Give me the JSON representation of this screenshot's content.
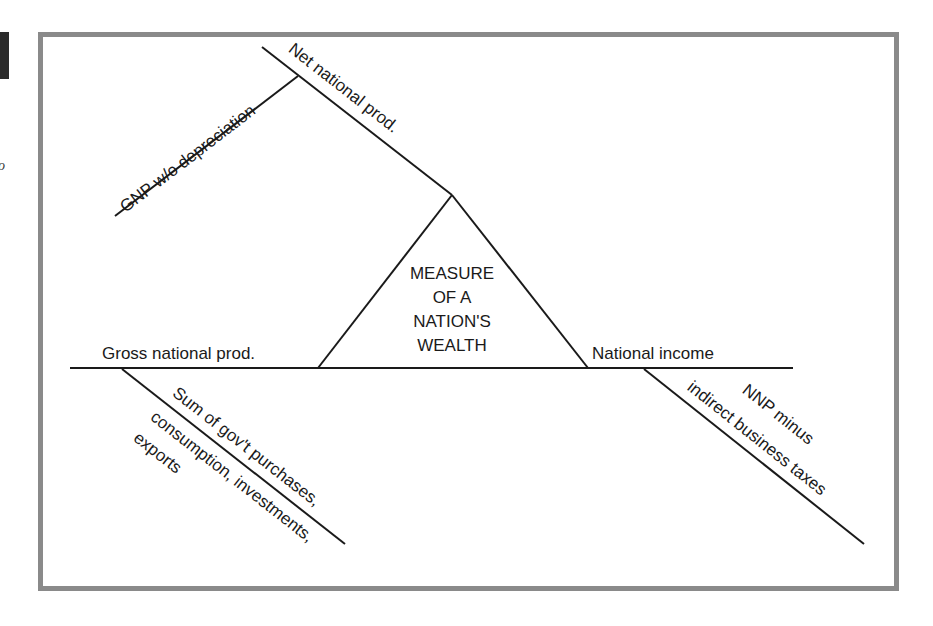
{
  "diagram": {
    "center": {
      "line1": "MEASURE",
      "line2": "OF A",
      "line3": "NATION'S",
      "line4": "WEALTH"
    },
    "labels": {
      "gnp": "Gross national prod.",
      "national_income": "National income",
      "nnp": "Net national prod.",
      "gnp_without_depreciation": "GNP w/o depreciation",
      "gnp_def_line1": "Sum of gov't purchases,",
      "gnp_def_line2": "consumption, investments,",
      "gnp_def_line3": "exports",
      "ni_def_line1": "NNP minus",
      "ni_def_line2": "indirect business taxes"
    },
    "colors": {
      "frame": "#8a8a8a",
      "ink": "#1a1a1a"
    }
  }
}
